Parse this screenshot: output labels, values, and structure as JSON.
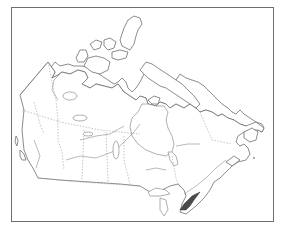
{
  "map": {
    "subject": "Outline map of Canada",
    "features": [
      "provincial-boundaries",
      "rivers",
      "lakes",
      "arctic-islands",
      "highlighted-region"
    ],
    "highlighted_region": {
      "name": "Southern Ontario / St. Lawrence Lowlands",
      "fill_color": "#4a4a4a"
    },
    "frame_color": "#6e6e6e",
    "line_color": "#7a7a7a",
    "background_color": "#ffffff"
  }
}
